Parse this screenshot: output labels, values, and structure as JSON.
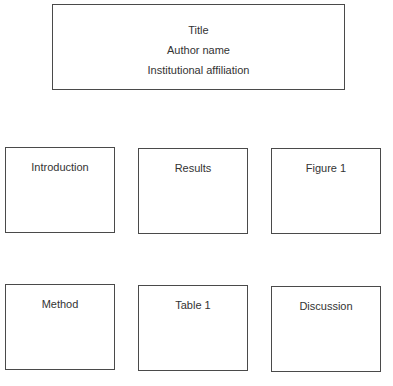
{
  "header": {
    "title": "Title",
    "author": "Author name",
    "affiliation": "Institutional affiliation"
  },
  "sections": {
    "row1": [
      {
        "label": "Introduction"
      },
      {
        "label": "Results"
      },
      {
        "label": "Figure 1"
      }
    ],
    "row2": [
      {
        "label": "Method"
      },
      {
        "label": "Table 1"
      },
      {
        "label": "Discussion"
      }
    ]
  },
  "colors": {
    "border": "#4a4a4a",
    "text": "#333333",
    "background": "#ffffff"
  }
}
